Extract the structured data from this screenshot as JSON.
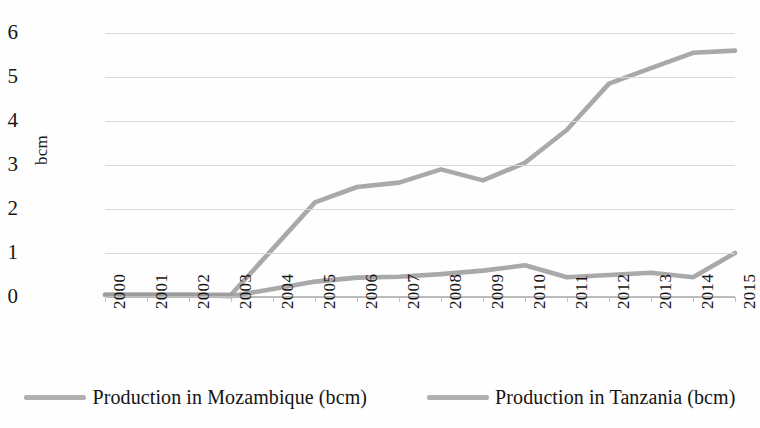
{
  "chart_data": {
    "type": "line",
    "title": "",
    "xlabel": "",
    "ylabel": "bcm",
    "ylim": [
      0,
      6
    ],
    "yticks": [
      0,
      1,
      2,
      3,
      4,
      5,
      6
    ],
    "ytick_labels": [
      "0",
      "1",
      "2",
      "3",
      "4",
      "5",
      "6"
    ],
    "grid": true,
    "legend_position": "bottom",
    "categories": [
      "2000",
      "2001",
      "2002",
      "2003",
      "2004",
      "2005",
      "2006",
      "2007",
      "2008",
      "2009",
      "2010",
      "2011",
      "2012",
      "2013",
      "2014",
      "2015"
    ],
    "series": [
      {
        "name": "Production in Mozambique (bcm)",
        "color": "#9a9a9a",
        "values": [
          0.05,
          0.05,
          0.05,
          0.05,
          1.1,
          2.15,
          2.5,
          2.6,
          2.9,
          2.65,
          3.05,
          3.8,
          4.85,
          5.2,
          5.55,
          5.6
        ]
      },
      {
        "name": "Production in Tanzania (bcm)",
        "color": "#9a9a9a",
        "values": [
          0.05,
          0.05,
          0.05,
          0.02,
          0.18,
          0.35,
          0.44,
          0.46,
          0.52,
          0.6,
          0.72,
          0.45,
          0.5,
          0.55,
          0.45,
          1.0
        ]
      }
    ]
  },
  "legend": {
    "items": [
      {
        "label": "Production in Mozambique (bcm)",
        "color": "#9a9a9a"
      },
      {
        "label": "Production in Tanzania (bcm)",
        "color": "#9a9a9a"
      }
    ]
  },
  "colors": {
    "gridline": "#d9d9d9",
    "axis": "#bdbdbd",
    "text": "#141414",
    "background": "#fefefe"
  }
}
